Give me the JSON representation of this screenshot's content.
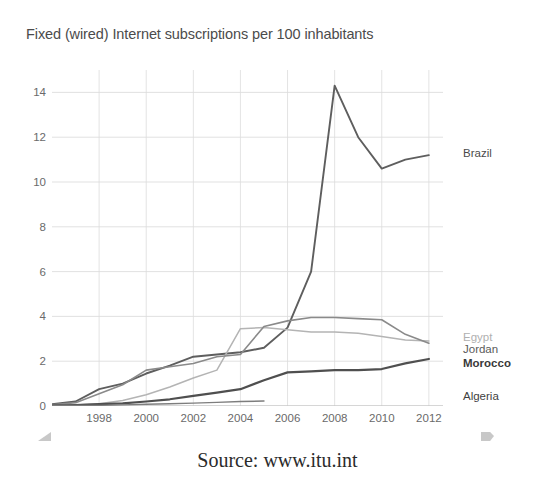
{
  "chart_data": {
    "type": "line",
    "title": "Fixed (wired) Internet subscriptions per 100 inhabitants",
    "xlabel": "",
    "ylabel": "",
    "xlim": [
      1996,
      2012.6
    ],
    "ylim": [
      0,
      15
    ],
    "grid": true,
    "legend_position": "right-inline-end-labels",
    "xticks": [
      "1998",
      "2000",
      "2002",
      "2004",
      "2006",
      "2008",
      "2010",
      "2012"
    ],
    "xtick_values": [
      1998,
      2000,
      2002,
      2004,
      2006,
      2008,
      2010,
      2012
    ],
    "yticks": [
      "0",
      "2",
      "4",
      "6",
      "8",
      "10",
      "12",
      "14"
    ],
    "ytick_values": [
      0,
      2,
      4,
      6,
      8,
      10,
      12,
      14
    ],
    "x": [
      1996,
      1997,
      1998,
      1999,
      2000,
      2001,
      2002,
      2003,
      2004,
      2005,
      2006,
      2007,
      2008,
      2009,
      2010,
      2011,
      2012
    ],
    "series": [
      {
        "name": "Brazil",
        "color": "#5e5e5e",
        "width": 1.9,
        "label_color": "#4a4a4a",
        "label_bold": false,
        "label_y": 11.3,
        "values": [
          0.08,
          0.2,
          0.75,
          1.0,
          1.45,
          1.8,
          2.2,
          2.3,
          2.4,
          2.6,
          3.5,
          6.0,
          14.3,
          12.0,
          10.6,
          11.0,
          11.2
        ]
      },
      {
        "name": "Egypt",
        "color": "#b4b4b4",
        "width": 1.5,
        "label_color": "#b0b0b0",
        "label_bold": false,
        "label_y": 3.1,
        "values": [
          0.02,
          0.05,
          0.1,
          0.25,
          0.5,
          0.85,
          1.25,
          1.6,
          3.45,
          3.5,
          3.4,
          3.3,
          3.3,
          3.25,
          3.1,
          2.95,
          2.9
        ]
      },
      {
        "name": "Jordan",
        "color": "#8a8a8a",
        "width": 1.6,
        "label_color": "#5a5a5a",
        "label_bold": false,
        "label_y": 2.55,
        "values": [
          0.05,
          0.15,
          0.55,
          0.95,
          1.6,
          1.75,
          1.9,
          2.2,
          2.3,
          3.55,
          3.8,
          3.95,
          3.95,
          3.9,
          3.85,
          3.2,
          2.8
        ]
      },
      {
        "name": "Morocco",
        "color": "#4f4f4f",
        "width": 2.2,
        "label_color": "#3a3a3a",
        "label_bold": true,
        "label_y": 1.9,
        "values": [
          0.02,
          0.04,
          0.08,
          0.12,
          0.2,
          0.3,
          0.45,
          0.6,
          0.75,
          1.15,
          1.5,
          1.55,
          1.6,
          1.6,
          1.65,
          1.9,
          2.1
        ]
      },
      {
        "name": "Algeria",
        "color": "#7d7d7d",
        "width": 1.4,
        "label_color": "#3f3f3f",
        "label_bold": false,
        "label_y": 0.45,
        "values": [
          0.01,
          0.02,
          0.03,
          0.05,
          0.08,
          0.1,
          0.13,
          0.16,
          0.2,
          0.22,
          null,
          null,
          null,
          null,
          null,
          null,
          null
        ]
      }
    ]
  },
  "caption": {
    "text": "Source: www.itu.int"
  },
  "artifacts": {
    "left_mark": "scan-corner-mark-left",
    "right_mark": "scan-corner-mark-right"
  }
}
